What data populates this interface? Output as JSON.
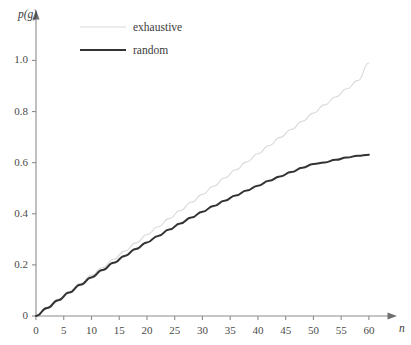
{
  "chart_data": {
    "type": "line",
    "title": "",
    "subtitle": "",
    "xlabel": "n",
    "ylabel": "p(g)",
    "xlim": [
      0,
      62
    ],
    "ylim": [
      0,
      1.08
    ],
    "grid": false,
    "legend_position": "top-center",
    "x_ticks": [
      0,
      5,
      10,
      15,
      20,
      25,
      30,
      35,
      40,
      45,
      50,
      55,
      60
    ],
    "x_tick_labels": [
      "0",
      "5",
      "10",
      "15",
      "20",
      "25",
      "30",
      "35",
      "40",
      "45",
      "50",
      "55",
      "60"
    ],
    "y_ticks": [
      0,
      0.2,
      0.4,
      0.6,
      0.8,
      1.0
    ],
    "y_tick_labels": [
      "0",
      "0.2",
      "0.4",
      "0.6",
      "0.8",
      "1.0"
    ],
    "series": [
      {
        "name": "exhaustive",
        "color": "#d9d9d9",
        "width": 1.1,
        "x": [
          0,
          2,
          4,
          6,
          8,
          10,
          12,
          14,
          16,
          18,
          20,
          22,
          24,
          26,
          28,
          30,
          32,
          34,
          36,
          38,
          40,
          42,
          44,
          46,
          48,
          50,
          52,
          54,
          56,
          58,
          60
        ],
        "values": [
          0.0,
          0.031,
          0.063,
          0.095,
          0.127,
          0.159,
          0.19,
          0.222,
          0.254,
          0.286,
          0.318,
          0.349,
          0.381,
          0.413,
          0.445,
          0.476,
          0.508,
          0.54,
          0.572,
          0.603,
          0.635,
          0.667,
          0.699,
          0.73,
          0.762,
          0.794,
          0.826,
          0.857,
          0.889,
          0.921,
          0.99
        ]
      },
      {
        "name": "random",
        "color": "#333333",
        "width": 2.0,
        "x": [
          0,
          2,
          4,
          6,
          8,
          10,
          12,
          14,
          16,
          18,
          20,
          22,
          24,
          26,
          28,
          30,
          32,
          34,
          36,
          38,
          40,
          42,
          44,
          46,
          48,
          50,
          52,
          54,
          56,
          58,
          60
        ],
        "values": [
          0.0,
          0.031,
          0.062,
          0.092,
          0.122,
          0.151,
          0.18,
          0.208,
          0.235,
          0.262,
          0.288,
          0.313,
          0.338,
          0.362,
          0.385,
          0.408,
          0.43,
          0.451,
          0.472,
          0.491,
          0.51,
          0.529,
          0.546,
          0.563,
          0.58,
          0.595,
          0.601,
          0.611,
          0.62,
          0.627,
          0.631
        ]
      }
    ],
    "annotations": []
  },
  "legend": {
    "entries": [
      {
        "label": "exhaustive"
      },
      {
        "label": "random"
      }
    ]
  },
  "axes": {
    "y_axis_title": "p(g)",
    "x_axis_title": "n"
  }
}
